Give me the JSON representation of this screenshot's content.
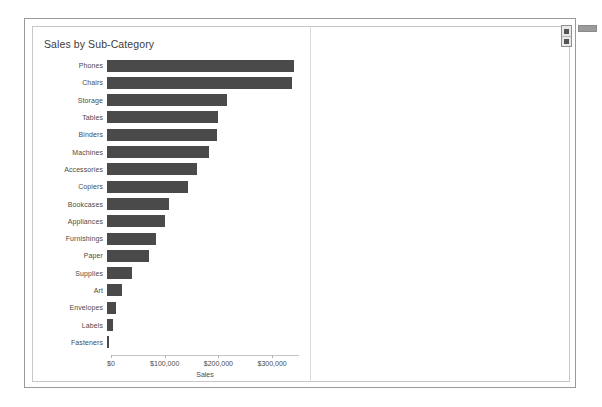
{
  "window": {
    "title": "Sales by Sub-Category"
  },
  "side_toolbar": {
    "buttons": [
      {
        "name": "toolbar-button-top",
        "icon": "square-glyph-icon"
      },
      {
        "name": "toolbar-button-bottom",
        "icon": "square-glyph-icon"
      }
    ]
  },
  "splitter": {
    "handle_name": "pane-splitter-handle"
  },
  "colors": {
    "bar": "#4a4a4a",
    "axis": "#c4c4c4",
    "text": "#4a4a4a",
    "title_text": "#3c3c3c",
    "panel_border": "#c8c8c8",
    "window_border": "#9a9a9a"
  },
  "chart_data": {
    "type": "bar",
    "orientation": "horizontal",
    "title": "Sales by Sub-Category",
    "xlabel": "Sales",
    "ylabel": "",
    "xlim": [
      0,
      350000
    ],
    "grid": false,
    "legend": null,
    "tick_labels": [
      "$0",
      "$100,000",
      "$200,000",
      "$300,000"
    ],
    "tick_values": [
      0,
      100000,
      200000,
      300000
    ],
    "categories": [
      "Phones",
      "Chairs",
      "Storage",
      "Tables",
      "Binders",
      "Machines",
      "Accessories",
      "Copiers",
      "Bookcases",
      "Appliances",
      "Furnishings",
      "Paper",
      "Supplies",
      "Art",
      "Envelopes",
      "Labels",
      "Fasteners"
    ],
    "values": [
      348000,
      345000,
      224000,
      207000,
      204000,
      189000,
      167000,
      150000,
      115000,
      108000,
      92000,
      79000,
      47000,
      27000,
      17000,
      12000,
      3000
    ]
  }
}
